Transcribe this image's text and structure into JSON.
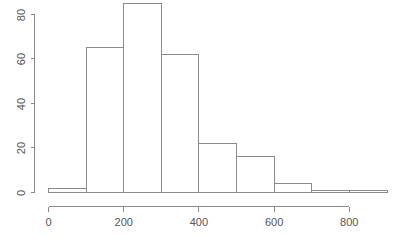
{
  "chart_data": {
    "type": "bar",
    "subtype": "histogram",
    "title": "",
    "subtitle": "",
    "xlabel": "",
    "ylabel": "",
    "categories": [
      "0-100",
      "100-200",
      "200-300",
      "300-400",
      "400-500",
      "500-600",
      "600-700",
      "700-800",
      "800-900"
    ],
    "bin_edges": [
      0,
      100,
      200,
      300,
      400,
      500,
      600,
      700,
      800,
      900
    ],
    "bin_width": 100,
    "values": [
      2,
      65,
      85,
      62,
      22,
      16,
      4,
      1,
      1
    ],
    "series": [
      {
        "name": "frequency",
        "values": [
          2,
          65,
          85,
          62,
          22,
          16,
          4,
          1,
          1
        ]
      }
    ],
    "xlim": [
      0,
      900
    ],
    "ylim": [
      0,
      85
    ],
    "x_ticks": [
      0,
      200,
      400,
      600,
      800
    ],
    "x_tick_labels": [
      "0",
      "200",
      "400",
      "600",
      "800"
    ],
    "y_ticks": [
      0,
      20,
      40,
      60,
      80
    ],
    "y_tick_labels": [
      "0",
      "20",
      "40",
      "60",
      "80"
    ],
    "y_tick_label_rotation": -90,
    "grid": false,
    "legend": null,
    "legend_position": "none",
    "annotations": [],
    "colors": {
      "background": "#ffffff",
      "axis": "#8a8a8a",
      "bar_stroke": "#8a8a8a",
      "bar_fill": "#ffffff",
      "tick_label": "#555555"
    }
  }
}
